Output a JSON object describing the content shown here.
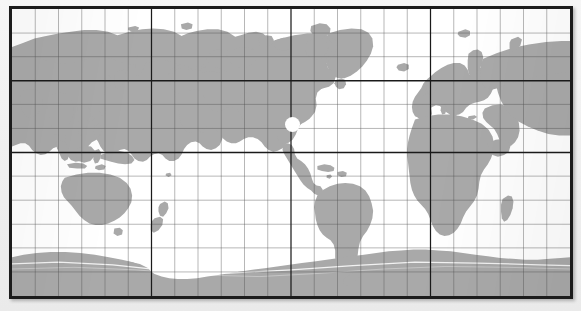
{
  "figure": {
    "kind": "world-map",
    "projection": "plate-carree",
    "frame": {
      "border_color": "#1c1c1c",
      "border_width_px": 3,
      "ocean_color": "#ffffff",
      "land_color": "#a9a9a9",
      "page_background": "#f1f1f1"
    },
    "extent": {
      "lon_min": -30,
      "lon_max": 330,
      "lat_min": -85,
      "lat_max": 85,
      "center_lon": 150
    },
    "graticule": {
      "visible": true,
      "meridian_step_deg": 15,
      "parallel_step_deg": 15,
      "minor_color": "#4d4d4d",
      "minor_width_px": 0.6,
      "major_color": "#1a1a1a",
      "major_width_px": 1.9,
      "major_meridians_deg": [
        60,
        150,
        240
      ],
      "major_parallels_deg": [
        23.5,
        0,
        -23.5
      ],
      "meridian_labels_deg": [
        -30,
        -15,
        0,
        15,
        30,
        45,
        60,
        75,
        90,
        105,
        120,
        135,
        150,
        165,
        180,
        195,
        210,
        225,
        240,
        255,
        270,
        285,
        300,
        315,
        330
      ],
      "parallel_labels_deg": [
        75,
        60,
        45,
        30,
        15,
        0,
        -15,
        -30,
        -45,
        -60,
        -75
      ]
    },
    "landmasses": [
      {
        "name": "eurasia",
        "label": "Eurasia"
      },
      {
        "name": "africa",
        "label": "Africa"
      },
      {
        "name": "north-america",
        "label": "North America"
      },
      {
        "name": "south-america",
        "label": "South America"
      },
      {
        "name": "australia",
        "label": "Australia"
      },
      {
        "name": "antarctica",
        "label": "Antarctica"
      },
      {
        "name": "greenland",
        "label": "Greenland"
      },
      {
        "name": "madagascar",
        "label": "Madagascar"
      },
      {
        "name": "new-zealand",
        "label": "New Zealand"
      },
      {
        "name": "japan",
        "label": "Japan"
      },
      {
        "name": "british-isles",
        "label": "British Isles"
      },
      {
        "name": "indonesia",
        "label": "Indonesia"
      },
      {
        "name": "philippines",
        "label": "Philippines"
      },
      {
        "name": "new-guinea",
        "label": "New Guinea"
      },
      {
        "name": "iceland",
        "label": "Iceland"
      },
      {
        "name": "sri-lanka",
        "label": "Sri Lanka"
      },
      {
        "name": "cuba",
        "label": "Cuba"
      },
      {
        "name": "borneo",
        "label": "Borneo"
      },
      {
        "name": "sumatra",
        "label": "Sumatra"
      },
      {
        "name": "hispaniola",
        "label": "Hispaniola"
      },
      {
        "name": "tasmania",
        "label": "Tasmania"
      },
      {
        "name": "svalbard",
        "label": "Svalbard"
      },
      {
        "name": "novaya-zemlya",
        "label": "Novaya Zemlya"
      },
      {
        "name": "sakhalin",
        "label": "Sakhalin"
      },
      {
        "name": "newfoundland",
        "label": "Newfoundland"
      },
      {
        "name": "taiwan",
        "label": "Taiwan"
      },
      {
        "name": "hainan",
        "label": "Hainan"
      },
      {
        "name": "falklands",
        "label": "Falkland Islands"
      },
      {
        "name": "tierra-del-fuego",
        "label": "Tierra del Fuego"
      },
      {
        "name": "baffin-island",
        "label": "Baffin Island"
      },
      {
        "name": "ellesmere-island",
        "label": "Ellesmere Island"
      },
      {
        "name": "victoria-island",
        "label": "Victoria Island"
      },
      {
        "name": "banks-island",
        "label": "Banks Island"
      },
      {
        "name": "kamchatka",
        "label": "Kamchatka"
      },
      {
        "name": "corsica-sardinia",
        "label": "Corsica / Sardinia"
      },
      {
        "name": "sicily",
        "label": "Sicily"
      },
      {
        "name": "crete",
        "label": "Crete"
      },
      {
        "name": "jamaica",
        "label": "Jamaica"
      },
      {
        "name": "fiji",
        "label": "Fiji"
      },
      {
        "name": "hawaii",
        "label": "Hawaii"
      },
      {
        "name": "south-georgia",
        "label": "South Georgia"
      },
      {
        "name": "kerguelen",
        "label": "Kerguelen"
      },
      {
        "name": "wrangel-island",
        "label": "Wrangel Island"
      },
      {
        "name": "severnaya-zemlya",
        "label": "Severnaya Zemlya"
      },
      {
        "name": "new-siberian-islands",
        "label": "New Siberian Islands"
      },
      {
        "name": "aleutians",
        "label": "Aleutian Islands"
      },
      {
        "name": "vancouver-island",
        "label": "Vancouver Island"
      },
      {
        "name": "sulawesi",
        "label": "Sulawesi"
      },
      {
        "name": "java",
        "label": "Java"
      },
      {
        "name": "timor",
        "label": "Timor"
      }
    ],
    "markers": [
      {
        "name": "location-dot",
        "label": "",
        "lon": 260,
        "lat": 19,
        "color": "#ffffff",
        "radius_px": 7
      }
    ]
  }
}
